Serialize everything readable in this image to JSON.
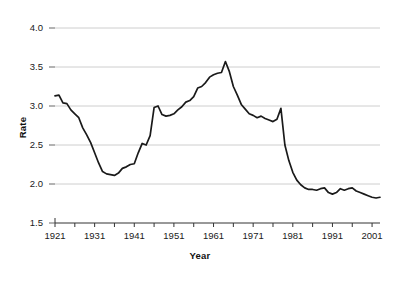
{
  "chart_data": {
    "type": "line",
    "title": "",
    "xlabel": "Year",
    "ylabel": "Rate",
    "xlim": [
      1921,
      2003
    ],
    "ylim": [
      1.5,
      4.0
    ],
    "grid": true,
    "legend": false,
    "legend_position": "none",
    "y_ticks": [
      "4.0",
      "3.5",
      "3.0",
      "2.5",
      "2.0",
      "1.5"
    ],
    "y_tick_values": [
      4.0,
      3.5,
      3.0,
      2.5,
      2.0,
      1.5
    ],
    "x_ticks": [
      "1921",
      "1931",
      "1941",
      "1951",
      "1961",
      "1971",
      "1981",
      "1991",
      "2001"
    ],
    "x_tick_values": [
      1921,
      1931,
      1941,
      1951,
      1961,
      1971,
      1981,
      1991,
      2001
    ],
    "x_minor_tick_values": [
      1926,
      1936,
      1946,
      1956,
      1966,
      1976,
      1986,
      1996
    ],
    "line_color": "#1a1a1a",
    "grid_color": "#c8c8c8",
    "series": [
      {
        "name": "Rate",
        "x": [
          1921,
          1922,
          1923,
          1924,
          1925,
          1926,
          1927,
          1928,
          1929,
          1930,
          1931,
          1932,
          1933,
          1934,
          1935,
          1936,
          1937,
          1938,
          1939,
          1940,
          1941,
          1942,
          1943,
          1944,
          1945,
          1946,
          1947,
          1948,
          1949,
          1950,
          1951,
          1952,
          1953,
          1954,
          1955,
          1956,
          1957,
          1958,
          1959,
          1960,
          1961,
          1962,
          1963,
          1964,
          1965,
          1966,
          1967,
          1968,
          1969,
          1970,
          1971,
          1972,
          1973,
          1974,
          1975,
          1976,
          1977,
          1978,
          1979,
          1980,
          1981,
          1982,
          1983,
          1984,
          1985,
          1986,
          1987,
          1988,
          1989,
          1990,
          1991,
          1992,
          1993,
          1994,
          1995,
          1996,
          1997,
          1998,
          1999,
          2000,
          2001,
          2002,
          2003
        ],
        "values": [
          3.13,
          3.14,
          3.04,
          3.03,
          2.95,
          2.9,
          2.85,
          2.72,
          2.63,
          2.53,
          2.4,
          2.27,
          2.16,
          2.13,
          2.12,
          2.11,
          2.14,
          2.2,
          2.22,
          2.25,
          2.26,
          2.4,
          2.52,
          2.5,
          2.62,
          2.98,
          3.0,
          2.89,
          2.87,
          2.88,
          2.9,
          2.95,
          2.99,
          3.05,
          3.07,
          3.12,
          3.23,
          3.25,
          3.3,
          3.37,
          3.4,
          3.42,
          3.43,
          3.57,
          3.44,
          3.25,
          3.14,
          3.02,
          2.96,
          2.9,
          2.88,
          2.85,
          2.87,
          2.84,
          2.82,
          2.8,
          2.83,
          2.97,
          2.5,
          2.3,
          2.15,
          2.05,
          1.99,
          1.95,
          1.93,
          1.93,
          1.92,
          1.94,
          1.95,
          1.89,
          1.87,
          1.89,
          1.94,
          1.92,
          1.94,
          1.95,
          1.91,
          1.89,
          1.87,
          1.85,
          1.83,
          1.82,
          1.83
        ]
      }
    ]
  }
}
